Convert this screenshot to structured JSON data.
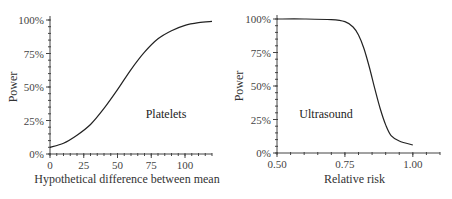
{
  "chart_data": [
    {
      "type": "line",
      "title": "",
      "annotation": "Platelets",
      "xlabel": "Hypothetical difference between mean",
      "ylabel": "Power",
      "xlim": [
        0,
        120
      ],
      "ylim": [
        0,
        100
      ],
      "x_ticks": [
        0,
        25,
        50,
        75,
        100
      ],
      "x_tick_labels": [
        "0",
        "25",
        "50",
        "75",
        "100"
      ],
      "y_ticks": [
        0,
        25,
        50,
        75,
        100
      ],
      "y_tick_labels": [
        "0%",
        "25%",
        "50%",
        "75%",
        "100%"
      ],
      "grid": false,
      "legend": "none",
      "series": [
        {
          "name": "Platelets",
          "x": [
            0,
            10,
            20,
            30,
            40,
            50,
            60,
            70,
            80,
            90,
            100,
            110,
            120
          ],
          "y": [
            5,
            8,
            14,
            22,
            34,
            48,
            63,
            76,
            86,
            92,
            96,
            98,
            99
          ]
        }
      ]
    },
    {
      "type": "line",
      "title": "",
      "annotation": "Ultrasound",
      "xlabel": "Relative risk",
      "ylabel": "Power",
      "xlim": [
        0.5,
        1.1
      ],
      "ylim": [
        0,
        100
      ],
      "x_ticks": [
        0.5,
        0.75,
        1.0
      ],
      "x_tick_labels": [
        "0.50",
        "0.75",
        "1.00"
      ],
      "y_ticks": [
        0,
        25,
        50,
        75,
        100
      ],
      "y_tick_labels": [
        "0%",
        "25%",
        "50%",
        "75%",
        "100%"
      ],
      "grid": false,
      "legend": "none",
      "series": [
        {
          "name": "Ultrasound",
          "x": [
            0.5,
            0.6,
            0.7,
            0.75,
            0.78,
            0.8,
            0.82,
            0.84,
            0.86,
            0.88,
            0.9,
            0.92,
            0.95,
            1.0
          ],
          "y": [
            100,
            100,
            99.5,
            98,
            94,
            88,
            78,
            64,
            48,
            33,
            21,
            13,
            9,
            6
          ]
        }
      ]
    }
  ],
  "layout": {
    "panels": [
      {
        "axis_x0": 50,
        "axis_x1": 212,
        "axis_y0": 154,
        "axis_y1": 20,
        "minor_x": 24,
        "minor_y": 20,
        "annot_x": 166,
        "annot_y": 118,
        "xlabel_y": 183
      },
      {
        "axis_x0": 51,
        "axis_x1": 214,
        "axis_y0": 153,
        "axis_y1": 19,
        "minor_x": 12,
        "minor_y": 20,
        "annot_x": 100,
        "annot_y": 118,
        "xlabel_y": 183
      }
    ]
  }
}
